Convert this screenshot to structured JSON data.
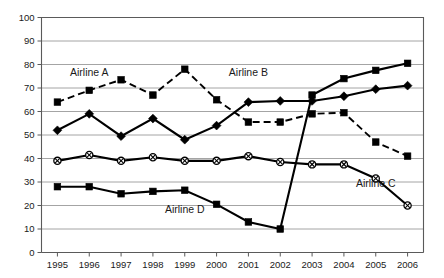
{
  "chart_data": {
    "type": "line",
    "title": "",
    "xlabel": "",
    "ylabel": "",
    "categories": [
      "1995",
      "1996",
      "1997",
      "1998",
      "1999",
      "2000",
      "2001",
      "2002",
      "2003",
      "2004",
      "2005",
      "2006"
    ],
    "ylim": [
      0,
      100
    ],
    "ytick_labels": [
      "0",
      "10",
      "20",
      "30",
      "40",
      "50",
      "60",
      "70",
      "80",
      "90",
      "100"
    ],
    "ytick_values": [
      0,
      10,
      20,
      30,
      40,
      50,
      60,
      70,
      80,
      90,
      100
    ],
    "grid": true,
    "legend_position": "inline-annotations",
    "series": [
      {
        "name": "Airline A",
        "marker": "filled-square",
        "linestyle": "dashed",
        "label_x_category": "1996",
        "label_y_value": 75,
        "values": [
          64,
          69,
          73.5,
          67,
          78,
          65,
          55.5,
          55.5,
          59,
          59.5,
          47,
          41
        ]
      },
      {
        "name": "Airline B",
        "marker": "filled-diamond",
        "linestyle": "solid",
        "label_x_category": "2001",
        "label_y_value": 75,
        "values": [
          52,
          59,
          49.5,
          57,
          48,
          54,
          64,
          64.5,
          64.5,
          66.5,
          69.5,
          71
        ]
      },
      {
        "name": "Airline C",
        "marker": "circle-x",
        "linestyle": "solid",
        "label_x_category": "2005",
        "label_y_value": 28,
        "values": [
          39,
          41.5,
          39,
          40.5,
          39,
          39,
          41,
          38.5,
          37.5,
          37.5,
          31.5,
          20
        ]
      },
      {
        "name": "Airline D",
        "marker": "filled-square",
        "linestyle": "solid",
        "label_x_category": "1999",
        "label_y_value": 17,
        "values": [
          28,
          28,
          25,
          26,
          26.5,
          20.5,
          13,
          10,
          67,
          74,
          77.5,
          80.5
        ]
      }
    ]
  },
  "colors": {
    "series_line": "#000000",
    "gridline": "#8d8d8d",
    "axis": "#5a5a5a",
    "background": "#ffffff",
    "text": "#1a1a1a"
  }
}
